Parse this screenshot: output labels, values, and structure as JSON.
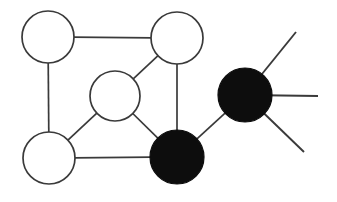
{
  "figure": {
    "width": 337,
    "height": 202,
    "background_color": "#ffffff",
    "stroke_color": "#3a3a3a",
    "fill_color": "#0d0d0d"
  },
  "chart_data": {
    "type": "diagram",
    "xlabel": "",
    "ylabel": "",
    "grid": false,
    "legend": "none",
    "node_styles": {
      "open": {
        "fill": "#ffffff",
        "stroke": "#3a3a3a",
        "stroke_width": 1.7
      },
      "filled": {
        "fill": "#0d0d0d",
        "stroke": "#0d0d0d",
        "stroke_width": 1.2
      }
    },
    "nodes": [
      {
        "id": "n1",
        "name": "top-left-node",
        "style": "open",
        "cx": 48,
        "cy": 37,
        "r": 26
      },
      {
        "id": "n2",
        "name": "top-right-node",
        "style": "open",
        "cx": 177,
        "cy": 38,
        "r": 26
      },
      {
        "id": "n3",
        "name": "center-node",
        "style": "open",
        "cx": 115,
        "cy": 96,
        "r": 25
      },
      {
        "id": "n4",
        "name": "bottom-left-node",
        "style": "open",
        "cx": 49,
        "cy": 158,
        "r": 26
      },
      {
        "id": "n5",
        "name": "bottom-filled-node",
        "style": "filled",
        "cx": 177,
        "cy": 157,
        "r": 27
      },
      {
        "id": "n6",
        "name": "right-filled-node",
        "style": "filled",
        "cx": 245,
        "cy": 95,
        "r": 27
      }
    ],
    "edges": [
      {
        "id": "e1",
        "name": "edge-top-left-to-top-right",
        "source": "n1",
        "target": "n2"
      },
      {
        "id": "e2",
        "name": "edge-top-left-to-bottom-left",
        "source": "n1",
        "target": "n4"
      },
      {
        "id": "e3",
        "name": "edge-top-right-to-center",
        "source": "n2",
        "target": "n3"
      },
      {
        "id": "e4",
        "name": "edge-top-right-to-bottom-filled",
        "source": "n2",
        "target": "n5"
      },
      {
        "id": "e5",
        "name": "edge-center-to-bottom-left",
        "source": "n3",
        "target": "n4"
      },
      {
        "id": "e6",
        "name": "edge-center-to-bottom-filled",
        "source": "n3",
        "target": "n5"
      },
      {
        "id": "e7",
        "name": "edge-bottom-left-to-bottom-filled",
        "source": "n4",
        "target": "n5"
      },
      {
        "id": "e8",
        "name": "edge-bottom-filled-to-right-filled",
        "source": "n5",
        "target": "n6"
      }
    ],
    "pendant_edges": [
      {
        "id": "p1",
        "name": "pendant-upper-right",
        "source": "n6",
        "x2": 296,
        "y2": 32
      },
      {
        "id": "p2",
        "name": "pendant-right",
        "source": "n6",
        "x2": 318,
        "y2": 96
      },
      {
        "id": "p3",
        "name": "pendant-lower-right",
        "source": "n6",
        "x2": 304,
        "y2": 152
      }
    ],
    "node_count": 6,
    "open_node_count": 4,
    "filled_node_count": 2,
    "edge_count": 8,
    "pendant_edge_count": 3
  }
}
